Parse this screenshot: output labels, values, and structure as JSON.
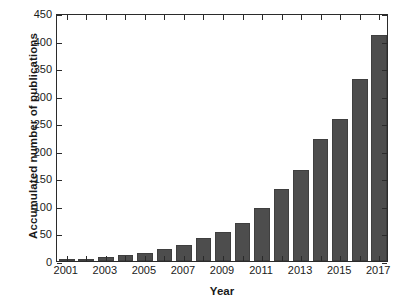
{
  "chart_data": {
    "type": "bar",
    "title": "",
    "xlabel": "Year",
    "ylabel": "Accumulated number of publications",
    "categories": [
      "2001",
      "2002",
      "2003",
      "2004",
      "2005",
      "2006",
      "2007",
      "2008",
      "2009",
      "2010",
      "2011",
      "2012",
      "2013",
      "2014",
      "2015",
      "2016",
      "2017"
    ],
    "values": [
      2,
      4,
      8,
      11,
      14,
      22,
      29,
      42,
      52,
      69,
      97,
      131,
      166,
      222,
      258,
      330,
      411
    ],
    "ylim": [
      0,
      450
    ],
    "ytick_labels": [
      "0",
      "50",
      "100",
      "150",
      "200",
      "250",
      "300",
      "350",
      "400",
      "450"
    ],
    "ytick_values": [
      0,
      50,
      100,
      150,
      200,
      250,
      300,
      350,
      400,
      450
    ],
    "xtick_labels": [
      "2001",
      "2003",
      "2005",
      "2007",
      "2009",
      "2011",
      "2013",
      "2015",
      "2017"
    ],
    "xtick_values": [
      "2001",
      "2003",
      "2005",
      "2007",
      "2009",
      "2011",
      "2013",
      "2015",
      "2017"
    ],
    "grid": false,
    "legend": false,
    "legend_position": "none",
    "bar_color": "#4d4d4d",
    "axis_color": "#2b2b2b",
    "background_color": "#ffffff"
  }
}
